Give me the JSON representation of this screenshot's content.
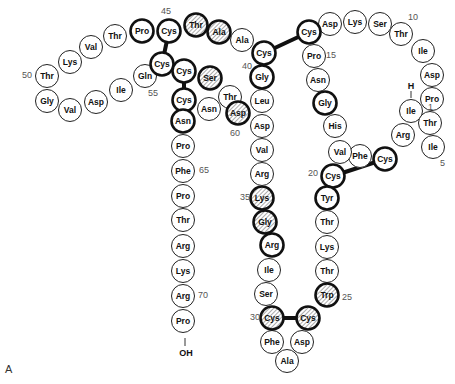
{
  "figure": {
    "panel_label": "A",
    "n_terminus_label": "H",
    "c_terminus_label": "OH",
    "hatch_color": "#888888",
    "residues": [
      {
        "n": 1,
        "aa": "Ile"
      },
      {
        "n": 2,
        "aa": "Arg"
      },
      {
        "n": 3,
        "aa": "Cys",
        "bold": true
      },
      {
        "n": 4,
        "aa": "Phe"
      },
      {
        "n": 5,
        "aa": "Ile"
      },
      {
        "n": 6,
        "aa": "Thr"
      },
      {
        "n": 7,
        "aa": "Pro"
      },
      {
        "n": 8,
        "aa": "Asp"
      },
      {
        "n": 9,
        "aa": "Ile"
      },
      {
        "n": 10,
        "aa": "Thr"
      },
      {
        "n": 11,
        "aa": "Ser"
      },
      {
        "n": 12,
        "aa": "Lys"
      },
      {
        "n": 13,
        "aa": "Asp"
      },
      {
        "n": 14,
        "aa": "Cys",
        "bold": true
      },
      {
        "n": 15,
        "aa": "Pro"
      },
      {
        "n": 16,
        "aa": "Asn"
      },
      {
        "n": 17,
        "aa": "Gly",
        "bold": true
      },
      {
        "n": 18,
        "aa": "His"
      },
      {
        "n": 19,
        "aa": "Val"
      },
      {
        "n": 20,
        "aa": "Cys",
        "bold": true
      },
      {
        "n": 21,
        "aa": "Tyr",
        "bold": true
      },
      {
        "n": 22,
        "aa": "Thr"
      },
      {
        "n": 23,
        "aa": "Lys"
      },
      {
        "n": 24,
        "aa": "Thr"
      },
      {
        "n": 25,
        "aa": "Trp",
        "bold": true,
        "hatch": true
      },
      {
        "n": 26,
        "aa": "Cys",
        "bold": true,
        "hatch": true
      },
      {
        "n": 27,
        "aa": "Asp"
      },
      {
        "n": 28,
        "aa": "Ala"
      },
      {
        "n": 29,
        "aa": "Phe"
      },
      {
        "n": 30,
        "aa": "Cys",
        "bold": true,
        "hatch": true
      },
      {
        "n": 31,
        "aa": "Ser"
      },
      {
        "n": 32,
        "aa": "Ile"
      },
      {
        "n": 33,
        "aa": "Arg",
        "bold": true
      },
      {
        "n": 34,
        "aa": "Gly",
        "bold": true,
        "hatch": true
      },
      {
        "n": 35,
        "aa": "Lys",
        "bold": true,
        "hatch": true
      },
      {
        "n": 36,
        "aa": "Arg"
      },
      {
        "n": 37,
        "aa": "Val"
      },
      {
        "n": 38,
        "aa": "Asp"
      },
      {
        "n": 39,
        "aa": "Leu"
      },
      {
        "n": 40,
        "aa": "Gly",
        "bold": true
      },
      {
        "n": 41,
        "aa": "Cys",
        "bold": true
      },
      {
        "n": 42,
        "aa": "Ala"
      },
      {
        "n": 43,
        "aa": "Ala",
        "bold": true,
        "hatch": true
      },
      {
        "n": 44,
        "aa": "Thr",
        "bold": true,
        "hatch": true
      },
      {
        "n": 45,
        "aa": "Cys",
        "bold": true
      },
      {
        "n": 46,
        "aa": "Pro",
        "bold": true
      },
      {
        "n": 47,
        "aa": "Thr"
      },
      {
        "n": 48,
        "aa": "Val"
      },
      {
        "n": 49,
        "aa": "Lys"
      },
      {
        "n": 50,
        "aa": "Thr"
      },
      {
        "n": 51,
        "aa": "Gly"
      },
      {
        "n": 52,
        "aa": "Val"
      },
      {
        "n": 53,
        "aa": "Asp"
      },
      {
        "n": 54,
        "aa": "Ile"
      },
      {
        "n": 55,
        "aa": "Gln"
      },
      {
        "n": 56,
        "aa": "Cys",
        "bold": true
      },
      {
        "n": 57,
        "aa": "Cys",
        "bold": true
      },
      {
        "n": 58,
        "aa": "Ser",
        "bold": true,
        "hatch": true
      },
      {
        "n": 59,
        "aa": "Thr"
      },
      {
        "n": 60,
        "aa": "Asp",
        "bold": true,
        "hatch": true
      },
      {
        "n": 61,
        "aa": "Asn"
      },
      {
        "n": 62,
        "aa": "Cys",
        "bold": true
      },
      {
        "n": 63,
        "aa": "Asn",
        "bold": true
      },
      {
        "n": 64,
        "aa": "Pro"
      },
      {
        "n": 65,
        "aa": "Phe"
      },
      {
        "n": 66,
        "aa": "Pro"
      },
      {
        "n": 67,
        "aa": "Thr"
      },
      {
        "n": 68,
        "aa": "Arg"
      },
      {
        "n": 69,
        "aa": "Lys"
      },
      {
        "n": 70,
        "aa": "Arg"
      },
      {
        "n": 71,
        "aa": "Pro"
      }
    ],
    "position_labels": [
      "1",
      "5",
      "10",
      "15",
      "20",
      "25",
      "30",
      "35",
      "40",
      "45",
      "50",
      "55",
      "60",
      "65",
      "70"
    ],
    "disulfide_bridges": [
      [
        3,
        20
      ],
      [
        14,
        41
      ],
      [
        26,
        30
      ],
      [
        45,
        56
      ],
      [
        57,
        62
      ]
    ]
  }
}
